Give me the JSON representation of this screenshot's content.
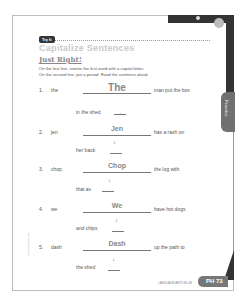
{
  "header": {
    "badge": "Try It",
    "title": "Capitalize Sentences",
    "subtitle": "Just Right!",
    "instructions": [
      "On the first line, rewrite the first word with a capital letter.",
      "On the second line, put a period. Read the sentence aloud."
    ]
  },
  "side_tab": {
    "label": "Practice"
  },
  "items": [
    {
      "number": "1.",
      "word": "the",
      "answer": "The",
      "rest": "man put the box",
      "continuation": "in the shed",
      "punct": "."
    },
    {
      "number": "2.",
      "word": "jen",
      "answer": "Jen",
      "rest": "has a rash on",
      "continuation": "her back",
      "punct": "."
    },
    {
      "number": "3.",
      "word": "chop",
      "answer": "Chop",
      "rest": "the log with",
      "continuation": "that ax",
      "punct": "."
    },
    {
      "number": "4.",
      "word": "we",
      "answer": "We",
      "rest": "have hot dogs",
      "continuation": "and chips",
      "punct": "."
    },
    {
      "number": "5.",
      "word": "dash",
      "answer": "Dash",
      "rest": "up the path to",
      "continuation": "the shed",
      "punct": "."
    }
  ],
  "arrow_glyph": "↓",
  "footer": {
    "label": "LANGUAGE ARTS BLUE",
    "page": "PH 73",
    "side_note": "Copyright information"
  }
}
